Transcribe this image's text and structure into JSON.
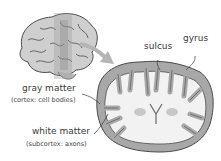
{
  "diagram": {
    "title": "",
    "labels": {
      "sulcus": "sulcus",
      "gyrus": "gyrus",
      "gray_matter": "gray matter",
      "gray_matter_note": "(cortex: cell bodies)",
      "white_matter": "white matter",
      "white_matter_note": "(subcortex: axons)"
    },
    "colors": {
      "cortex": "#a8a8a8",
      "outline": "#4a4a4a",
      "white_matter": "#f2f2f2",
      "slice_band": "#c8c8c8",
      "arrow": "#b5b5b5",
      "text": "#3a3a3a"
    }
  }
}
